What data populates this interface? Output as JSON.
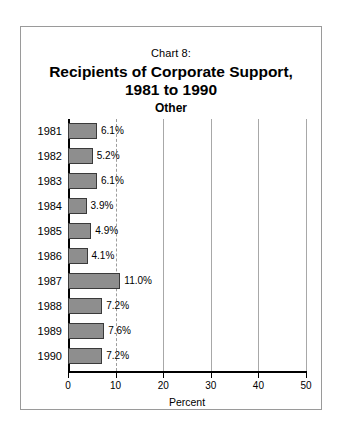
{
  "frame": {
    "border_color": "#9a9a9a"
  },
  "header": {
    "chart_number": "Chart 8:",
    "title_line1": "Recipients of Corporate Support,",
    "title_line2": "1981 to 1990",
    "subtitle": "Other"
  },
  "axis": {
    "x_title": "Percent",
    "x_ticks": [
      "0",
      "10",
      "20",
      "30",
      "40",
      "50"
    ]
  },
  "bars": [
    {
      "year": "1981",
      "value": 6.1,
      "label": "6.1%"
    },
    {
      "year": "1982",
      "value": 5.2,
      "label": "5.2%"
    },
    {
      "year": "1983",
      "value": 6.1,
      "label": "6.1%"
    },
    {
      "year": "1984",
      "value": 3.9,
      "label": "3.9%"
    },
    {
      "year": "1985",
      "value": 4.9,
      "label": "4.9%"
    },
    {
      "year": "1986",
      "value": 4.1,
      "label": "4.1%"
    },
    {
      "year": "1987",
      "value": 11.0,
      "label": "11.0%"
    },
    {
      "year": "1988",
      "value": 7.2,
      "label": "7.2%"
    },
    {
      "year": "1989",
      "value": 7.6,
      "label": "7.6%"
    },
    {
      "year": "1990",
      "value": 7.2,
      "label": "7.2%"
    }
  ],
  "style": {
    "bar_fill": "#8e8e8e",
    "bar_stroke": "#3a3a3a",
    "gridline_color": "#a8a8a8",
    "axis_color": "#000000"
  },
  "chart_data": {
    "type": "bar",
    "orientation": "horizontal",
    "title": "Chart 8: Recipients of Corporate Support, 1981 to 1990",
    "subtitle": "Other",
    "categories": [
      "1981",
      "1982",
      "1983",
      "1984",
      "1985",
      "1986",
      "1987",
      "1988",
      "1989",
      "1990"
    ],
    "values": [
      6.1,
      5.2,
      6.1,
      3.9,
      4.9,
      4.1,
      11.0,
      7.2,
      7.6,
      7.2
    ],
    "data_labels": [
      "6.1%",
      "5.2%",
      "6.1%",
      "3.9%",
      "4.9%",
      "4.1%",
      "11.0%",
      "7.2%",
      "7.6%",
      "7.2%"
    ],
    "xlabel": "Percent",
    "ylabel": "",
    "xlim": [
      0,
      50
    ],
    "xticks": [
      0,
      10,
      20,
      30,
      40,
      50
    ],
    "grid": true,
    "grid_axis": "x",
    "legend": false
  }
}
